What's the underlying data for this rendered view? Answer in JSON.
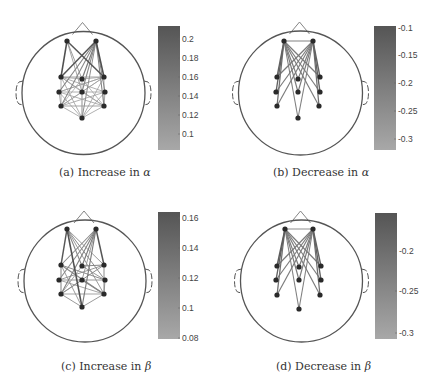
{
  "figure": {
    "panels": [
      {
        "id": "a",
        "caption_prefix": "(a) Increase in ",
        "caption_symbol": "α",
        "caption_pos": [
          59,
          166
        ],
        "head": {
          "cx": 83.5,
          "cy": 93,
          "r": 61.5
        },
        "electrodes": [
          [
            67,
            41
          ],
          [
            96,
            41
          ],
          [
            61,
            77
          ],
          [
            82,
            79
          ],
          [
            104,
            77
          ],
          [
            59,
            92
          ],
          [
            82,
            92
          ],
          [
            105,
            92
          ],
          [
            61,
            106
          ],
          [
            104,
            106
          ],
          [
            82,
            118
          ]
        ],
        "edges": [
          [
            0,
            2,
            0.95
          ],
          [
            0,
            4,
            0.9
          ],
          [
            1,
            2,
            0.9
          ],
          [
            1,
            4,
            0.95
          ],
          [
            1,
            3,
            0.6
          ],
          [
            1,
            5,
            0.55
          ],
          [
            1,
            6,
            0.5
          ],
          [
            1,
            8,
            0.5
          ],
          [
            1,
            9,
            0.55
          ],
          [
            1,
            10,
            0.45
          ],
          [
            1,
            7,
            0.5
          ],
          [
            0,
            3,
            0.4
          ],
          [
            0,
            6,
            0.35
          ],
          [
            2,
            4,
            0.35
          ],
          [
            2,
            3,
            0.3
          ],
          [
            3,
            4,
            0.3
          ],
          [
            2,
            7,
            0.3
          ],
          [
            2,
            9,
            0.3
          ],
          [
            2,
            10,
            0.3
          ],
          [
            2,
            6,
            0.25
          ],
          [
            4,
            5,
            0.3
          ],
          [
            4,
            8,
            0.3
          ],
          [
            4,
            10,
            0.3
          ],
          [
            4,
            6,
            0.25
          ],
          [
            5,
            7,
            0.3
          ],
          [
            5,
            9,
            0.3
          ],
          [
            5,
            10,
            0.3
          ],
          [
            5,
            4,
            0.25
          ],
          [
            7,
            8,
            0.3
          ],
          [
            7,
            10,
            0.3
          ],
          [
            8,
            9,
            0.35
          ],
          [
            8,
            10,
            0.3
          ],
          [
            9,
            10,
            0.3
          ],
          [
            6,
            8,
            0.25
          ],
          [
            6,
            9,
            0.25
          ],
          [
            6,
            10,
            0.25
          ],
          [
            3,
            8,
            0.25
          ],
          [
            3,
            9,
            0.25
          ],
          [
            3,
            10,
            0.25
          ],
          [
            2,
            8,
            0.3
          ],
          [
            4,
            9,
            0.3
          ],
          [
            5,
            8,
            0.3
          ],
          [
            7,
            9,
            0.3
          ]
        ],
        "colorbar": {
          "x": 158,
          "y": 26,
          "w": 22,
          "h": 124,
          "dark": "#555555",
          "light": "#a8a8a8",
          "ticks": [
            {
              "label": "0.2",
              "y": 39
            },
            {
              "label": "0.18",
              "y": 58
            },
            {
              "label": "0.16",
              "y": 77
            },
            {
              "label": "0.14",
              "y": 96
            },
            {
              "label": "0.12",
              "y": 115
            },
            {
              "label": "0.1",
              "y": 134
            }
          ]
        }
      },
      {
        "id": "b",
        "caption_prefix": "(b) Decrease in ",
        "caption_symbol": "α",
        "caption_pos": [
          273,
          166
        ],
        "head": {
          "cx": 300.5,
          "cy": 93,
          "r": 62
        },
        "electrodes": [
          [
            284,
            41
          ],
          [
            313,
            41
          ],
          [
            277,
            77
          ],
          [
            298,
            79
          ],
          [
            320,
            77
          ],
          [
            276,
            92
          ],
          [
            298,
            92
          ],
          [
            320,
            92
          ],
          [
            277,
            106
          ],
          [
            319,
            106
          ],
          [
            298,
            118
          ]
        ],
        "edges": [
          [
            0,
            1,
            0.5
          ],
          [
            0,
            2,
            0.8
          ],
          [
            0,
            3,
            0.6
          ],
          [
            0,
            4,
            0.6
          ],
          [
            0,
            5,
            0.8
          ],
          [
            0,
            6,
            0.6
          ],
          [
            0,
            7,
            0.6
          ],
          [
            0,
            8,
            0.7
          ],
          [
            0,
            9,
            0.6
          ],
          [
            0,
            10,
            0.55
          ],
          [
            1,
            2,
            0.6
          ],
          [
            1,
            3,
            0.6
          ],
          [
            1,
            4,
            0.8
          ],
          [
            1,
            5,
            0.6
          ],
          [
            1,
            6,
            0.6
          ],
          [
            1,
            7,
            0.8
          ],
          [
            1,
            8,
            0.6
          ],
          [
            1,
            9,
            0.7
          ],
          [
            1,
            10,
            0.55
          ]
        ],
        "colorbar": {
          "x": 374,
          "y": 26,
          "w": 22,
          "h": 124,
          "dark": "#555555",
          "light": "#a8a8a8",
          "ticks": [
            {
              "label": "-0.1",
              "y": 28
            },
            {
              "label": "-0.15",
              "y": 55
            },
            {
              "label": "-0.2",
              "y": 83
            },
            {
              "label": "-0.25",
              "y": 111
            },
            {
              "label": "-0.3",
              "y": 139
            }
          ]
        }
      },
      {
        "id": "c",
        "caption_prefix": "(c) Increase in ",
        "caption_symbol": "β",
        "caption_pos": [
          61,
          360
        ],
        "head": {
          "cx": 85,
          "cy": 281,
          "r": 61
        },
        "electrodes": [
          [
            67,
            229
          ],
          [
            96,
            229
          ],
          [
            61,
            265
          ],
          [
            82,
            266
          ],
          [
            104,
            265
          ],
          [
            59,
            280
          ],
          [
            82,
            280
          ],
          [
            105,
            280
          ],
          [
            61,
            294
          ],
          [
            104,
            294
          ],
          [
            82,
            307
          ]
        ],
        "edges": [
          [
            0,
            2,
            0.9
          ],
          [
            0,
            10,
            0.95
          ],
          [
            0,
            3,
            0.5
          ],
          [
            0,
            4,
            0.4
          ],
          [
            0,
            7,
            0.45
          ],
          [
            0,
            9,
            0.4
          ],
          [
            1,
            4,
            0.9
          ],
          [
            1,
            2,
            0.5
          ],
          [
            1,
            3,
            0.6
          ],
          [
            1,
            5,
            0.5
          ],
          [
            1,
            8,
            0.55
          ],
          [
            1,
            10,
            0.6
          ],
          [
            1,
            6,
            0.4
          ],
          [
            2,
            9,
            0.5
          ],
          [
            2,
            7,
            0.45
          ],
          [
            2,
            10,
            0.4
          ],
          [
            3,
            4,
            0.5
          ],
          [
            3,
            7,
            0.4
          ],
          [
            3,
            8,
            0.35
          ],
          [
            4,
            8,
            0.45
          ],
          [
            4,
            5,
            0.4
          ],
          [
            5,
            7,
            0.4
          ],
          [
            5,
            9,
            0.35
          ],
          [
            6,
            9,
            0.5
          ],
          [
            6,
            8,
            0.35
          ],
          [
            8,
            10,
            0.4
          ],
          [
            9,
            10,
            0.4
          ],
          [
            8,
            9,
            0.35
          ],
          [
            2,
            8,
            0.5
          ],
          [
            4,
            9,
            0.45
          ],
          [
            7,
            9,
            0.4
          ]
        ],
        "colorbar": {
          "x": 158,
          "y": 212,
          "w": 22,
          "h": 127,
          "dark": "#555555",
          "light": "#a8a8a8",
          "ticks": [
            {
              "label": "0.16",
              "y": 218
            },
            {
              "label": "0.14",
              "y": 248
            },
            {
              "label": "0.12",
              "y": 278
            },
            {
              "label": "0.1",
              "y": 308
            },
            {
              "label": "0.08",
              "y": 338
            }
          ]
        }
      },
      {
        "id": "d",
        "caption_prefix": "(d) Decrease in ",
        "caption_symbol": "β",
        "caption_pos": [
          276,
          360
        ],
        "head": {
          "cx": 301.5,
          "cy": 281,
          "r": 61
        },
        "electrodes": [
          [
            285,
            229
          ],
          [
            313,
            229
          ],
          [
            277,
            266
          ],
          [
            299,
            267
          ],
          [
            321,
            266
          ],
          [
            276,
            280
          ],
          [
            299,
            280
          ],
          [
            321,
            280
          ],
          [
            277,
            295
          ],
          [
            320,
            295
          ],
          [
            299,
            309
          ]
        ],
        "edges": [
          [
            0,
            1,
            0.45
          ],
          [
            0,
            2,
            0.85
          ],
          [
            0,
            3,
            0.6
          ],
          [
            0,
            4,
            0.6
          ],
          [
            0,
            5,
            0.8
          ],
          [
            0,
            6,
            0.6
          ],
          [
            0,
            7,
            0.6
          ],
          [
            0,
            8,
            0.7
          ],
          [
            0,
            9,
            0.6
          ],
          [
            0,
            10,
            0.55
          ],
          [
            1,
            2,
            0.6
          ],
          [
            1,
            3,
            0.6
          ],
          [
            1,
            4,
            0.8
          ],
          [
            1,
            5,
            0.6
          ],
          [
            1,
            6,
            0.6
          ],
          [
            1,
            7,
            0.8
          ],
          [
            1,
            8,
            0.6
          ],
          [
            1,
            9,
            0.7
          ],
          [
            1,
            10,
            0.55
          ]
        ],
        "colorbar": {
          "x": 375,
          "y": 213,
          "w": 22,
          "h": 126,
          "dark": "#555555",
          "light": "#a8a8a8",
          "ticks": [
            {
              "label": "-0.2",
              "y": 251
            },
            {
              "label": "-0.25",
              "y": 291
            },
            {
              "label": "-0.3",
              "y": 333
            }
          ]
        }
      }
    ]
  },
  "captions": {
    "a": {
      "prefix": "(a) Increase in ",
      "symbol": "α"
    },
    "b": {
      "prefix": "(b) Decrease in ",
      "symbol": "α"
    },
    "c": {
      "prefix": "(c) Increase in ",
      "symbol": "β"
    },
    "d": {
      "prefix": "(d) Decrease in ",
      "symbol": "β"
    }
  },
  "colors": {
    "head_outline": "#555555",
    "electrode": "#2a2a2a",
    "edge_dark": "#4a4a4a",
    "edge_light": "#c4c4c4"
  }
}
